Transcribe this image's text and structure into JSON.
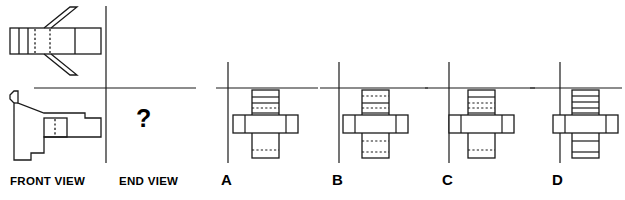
{
  "figure": {
    "type": "orthographic-projection-multiple-choice",
    "stroke_color": "#1a1a1a",
    "background_color": "#ffffff",
    "width": 625,
    "height": 200
  },
  "prompt": {
    "front_view_label": "FRONT VIEW",
    "end_view_label": "END VIEW",
    "question_mark": "?"
  },
  "options": [
    {
      "letter": "A",
      "shape": "cross",
      "vertical_bar_bands": [
        "solid",
        "solid",
        "dotted",
        "plain",
        "plain",
        "dotted"
      ],
      "horizontal_bar_segments": 4
    },
    {
      "letter": "B",
      "shape": "cross",
      "vertical_bar_bands": [
        "dotted",
        "dotted",
        "solid",
        "plain",
        "dotted",
        "dotted"
      ],
      "horizontal_bar_segments": 4
    },
    {
      "letter": "C",
      "shape": "cross",
      "vertical_bar_bands": [
        "solid",
        "dotted",
        "dotted",
        "plain",
        "plain",
        "dotted"
      ],
      "horizontal_bar_segments": 4
    },
    {
      "letter": "D",
      "shape": "cross",
      "vertical_bar_bands": [
        "solid",
        "solid",
        "solid",
        "solid",
        "solid",
        "solid"
      ],
      "horizontal_bar_segments": 4
    }
  ],
  "axes": {
    "prompt_axis_x": 106,
    "prompt_axis_y": 88,
    "option_axis_ys": 88
  }
}
